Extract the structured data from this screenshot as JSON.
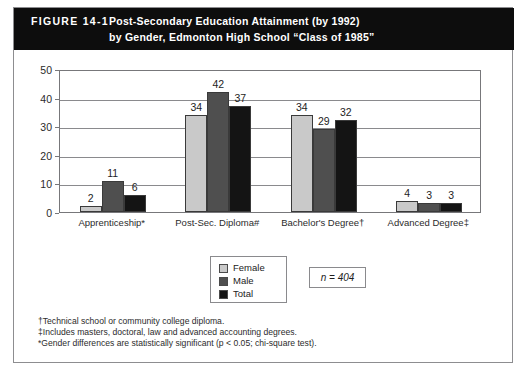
{
  "figure": {
    "number_label": "FIGURE 14-1",
    "title_line_1": "Post-Secondary Education Attainment (by 1992)",
    "title_line_2": "by Gender, Edmonton High School “Class of 1985”",
    "sample_size_note": "n = 404"
  },
  "footnotes": [
    "†Technical school or community college diploma.",
    "‡Includes masters, doctoral, law and advanced accounting degrees.",
    "*Gender differences are statistically significant (p < 0.05; chi-square test)."
  ],
  "colors": {
    "female": "#c9c9c9",
    "male": "#4f4f4f",
    "total": "#141414",
    "title_bar": "#0d0d0d",
    "frame_border": "#77777a"
  },
  "chart_data": {
    "type": "bar",
    "title": "Post-Secondary Education Attainment (by 1992) by Gender, Edmonton High School “Class of 1985”",
    "xlabel": "",
    "ylabel": "",
    "ylim": [
      0,
      50
    ],
    "yticks": [
      0,
      10,
      20,
      30,
      40,
      50
    ],
    "grid": true,
    "legend_position": "bottom-center",
    "categories": [
      "Apprenticeship*",
      "Post-Sec. Diploma#",
      "Bachelor's Degree†",
      "Advanced Degree‡"
    ],
    "series": [
      {
        "name": "Female",
        "color": "#c9c9c9",
        "values": [
          2,
          34,
          34,
          4
        ]
      },
      {
        "name": "Male",
        "color": "#4f4f4f",
        "values": [
          11,
          42,
          29,
          3
        ]
      },
      {
        "name": "Total",
        "color": "#141414",
        "values": [
          6,
          37,
          32,
          3
        ]
      }
    ],
    "n": 404
  }
}
